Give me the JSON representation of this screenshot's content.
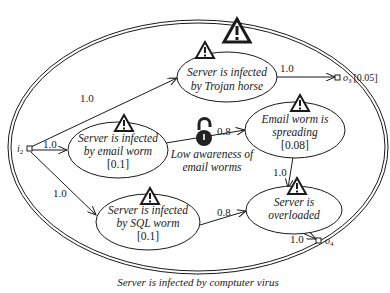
{
  "diagram": {
    "caption": "Server is infected by comptuter virus",
    "container": {
      "label": "Server is infected by comptuter virus",
      "has_warning": true
    },
    "input_port": {
      "name": "i",
      "subscript": "2"
    },
    "output_ports": [
      {
        "name": "o",
        "subscript": "3",
        "value": "[0.05]"
      },
      {
        "name": "o",
        "subscript": "4",
        "value": ""
      }
    ],
    "nodes": [
      {
        "id": "trojan",
        "lines": [
          "Server is infected",
          "by Trojan horse"
        ],
        "value": ""
      },
      {
        "id": "email_worm",
        "lines": [
          "Server is infected",
          "by email worm"
        ],
        "value": "[0.1]"
      },
      {
        "id": "email_spreading",
        "lines": [
          "Email worm is",
          "spreading"
        ],
        "value": "[0.08]"
      },
      {
        "id": "sql_worm",
        "lines": [
          "Server is infected",
          "by SQL worm"
        ],
        "value": "[0.1]"
      },
      {
        "id": "overloaded",
        "lines": [
          "Server is",
          "overloaded"
        ],
        "value": ""
      }
    ],
    "edges": [
      {
        "from": "i2",
        "to": "trojan",
        "label": "1.0"
      },
      {
        "from": "i2",
        "to": "email_worm",
        "label": "1.0"
      },
      {
        "from": "i2",
        "to": "sql_worm",
        "label": "1.0"
      },
      {
        "from": "trojan",
        "to": "o3",
        "label": "1.0"
      },
      {
        "from": "email_worm",
        "to": "email_spreading",
        "label": "0.8"
      },
      {
        "from": "email_spreading",
        "to": "overloaded",
        "label": "1.0"
      },
      {
        "from": "sql_worm",
        "to": "overloaded",
        "label": "0.8"
      },
      {
        "from": "overloaded",
        "to": "o4",
        "label": "1.0"
      }
    ],
    "vulnerability": {
      "icon": "unlocked-padlock-icon",
      "lines": [
        "Low awareness of",
        "email worms"
      ]
    },
    "warning_icon": "warning-triangle-icon",
    "colors": {
      "stroke": "#1a1a1a",
      "background": "#ffffff",
      "lock": "#222222"
    }
  }
}
